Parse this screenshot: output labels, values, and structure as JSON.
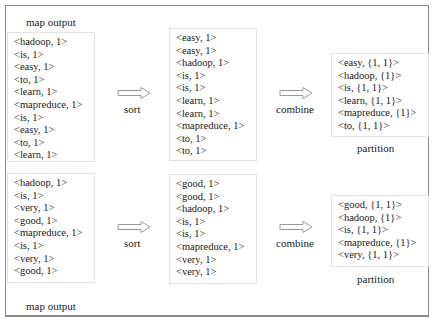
{
  "diagram": {
    "rows": [
      {
        "map_output_label": "map output",
        "map_output": [
          "<hadoop, 1>",
          "<is, 1>",
          "<easy, 1>",
          "<to, 1>",
          "<learn, 1>",
          "<mapreduce, 1>",
          "<is, 1>",
          "<easy, 1>",
          "<to, 1>",
          "<learn, 1>"
        ],
        "sort_label": "sort",
        "sorted": [
          "<easy, 1>",
          "<easy, 1>",
          "<hadoop, 1>",
          "<is, 1>",
          "<is, 1>",
          "<learn, 1>",
          "<learn, 1>",
          "<mapreduce, 1>",
          "<to, 1>",
          "<to, 1>"
        ],
        "combine_label": "combine",
        "combined": [
          "<easy, {1, 1}>",
          "<hadoop, {1}>",
          "<is, {1, 1}>",
          "<learn, {1, 1}>",
          "<mapreduce, {1}>",
          "<to, {1, 1}>"
        ],
        "partition_label": "partition"
      },
      {
        "map_output_label": "map output",
        "map_output": [
          "<hadoop, 1>",
          "<is, 1>",
          "<very, 1>",
          "<good, 1>",
          "<mapreduce, 1>",
          "<is, 1>",
          "<very, 1>",
          "<good, 1>"
        ],
        "sort_label": "sort",
        "sorted": [
          "<good, 1>",
          "<good, 1>",
          "<hadoop, 1>",
          "<is, 1>",
          "<is, 1>",
          "<mapreduce, 1>",
          "<very, 1>",
          "<very, 1>"
        ],
        "combine_label": "combine",
        "combined": [
          "<good, {1, 1}>",
          "<hadoop, {1}>",
          "<is, {1, 1}>",
          "<mapreduce, {1}>",
          "<very, {1, 1}>"
        ],
        "partition_label": "partition"
      }
    ],
    "colors": {
      "frame": "#8a8a8a",
      "box_border": "#e2e2e2",
      "arrow": "#9a9a9a",
      "text": "#1a1a1a"
    }
  }
}
